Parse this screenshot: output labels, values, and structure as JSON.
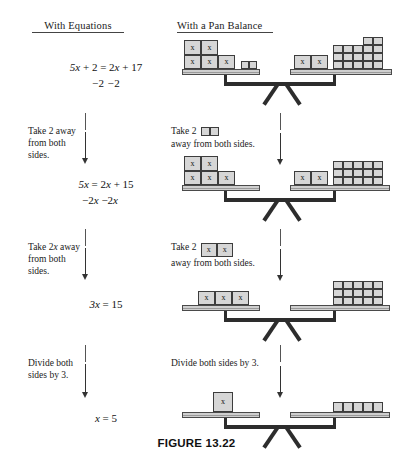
{
  "figure": {
    "caption": "FIGURE 13.22",
    "columns": {
      "equations_header": "With Equations",
      "pan_balance_header": "With a Pan Balance"
    }
  },
  "steps": [
    {
      "id": "step-1",
      "equation_main": "5x + 2 = 2x + 17",
      "equation_operation": "−2          −2",
      "equation_left": "5x + 2",
      "equation_right": "2x + 17",
      "instruction_equations": "",
      "instruction_pan_prefix": "",
      "instruction_pan_suffix": "",
      "balance": {
        "left_x_blocks": 5,
        "left_units": 2,
        "right_x_blocks": 2,
        "right_units": 17,
        "right_grid_cols": 4,
        "right_grid_rows": 3,
        "right_extra_top": 2
      }
    },
    {
      "id": "step-2",
      "equation_main": "5x = 2x + 15",
      "equation_operation": "−2x   −2x",
      "instruction_equations": "Take 2 away from both sides.",
      "instruction_pan_prefix": "Take 2",
      "instruction_pan_suffix": "away from both sides.",
      "removed_piece_type": "unit",
      "removed_piece_count": 2,
      "balance": {
        "left_x_blocks": 5,
        "left_units": 0,
        "right_x_blocks": 2,
        "right_units": 15,
        "right_grid_cols": 5,
        "right_grid_rows": 3
      }
    },
    {
      "id": "step-3",
      "equation_main": "3x = 15",
      "equation_operation": "",
      "instruction_equations": "Take 2x away from both sides.",
      "instruction_pan_prefix": "Take 2",
      "instruction_pan_suffix": "away from both sides.",
      "removed_piece_type": "x",
      "removed_piece_count": 2,
      "removed_piece_label": "x",
      "balance": {
        "left_x_blocks": 3,
        "left_units": 0,
        "right_x_blocks": 0,
        "right_units": 15,
        "right_grid_cols": 5,
        "right_grid_rows": 3
      }
    },
    {
      "id": "step-4",
      "equation_main": "x = 5",
      "equation_operation": "",
      "instruction_equations": "Divide both sides by 3.",
      "instruction_pan_full": "Divide both sides by 3.",
      "balance": {
        "left_x_blocks": 1,
        "left_units": 0,
        "right_x_blocks": 0,
        "right_units": 5,
        "right_grid_cols": 5,
        "right_grid_rows": 1
      }
    }
  ],
  "labels": {
    "x_block_label": "x",
    "eq1_main_pre": "5",
    "eq1_main_post": " + 2 = 2",
    "eq1_main_tail": " + 17",
    "eq1_op": "−2            −2",
    "eq2_main_pre": "5",
    "eq2_main_mid": " = 2",
    "eq2_main_tail": " + 15",
    "eq2_op_pre": "−2",
    "eq2_op_mid": "   −2",
    "eq3_main_pre": "3",
    "eq3_main_tail": " = 15",
    "eq4_main_pre": "",
    "eq4_main_tail": " = 5",
    "note1_l1": "Take 2 away",
    "note1_l2": "from both",
    "note1_l3": "sides.",
    "note2_l1": "Take 2x away",
    "note2_l2": "from both",
    "note2_l3": "sides.",
    "note3_l1": "Divide both",
    "note3_l2": "sides by 3.",
    "rnote1_l1": "Take 2",
    "rnote1_l2": "away from both sides.",
    "rnote2_l1": "Take 2",
    "rnote2_l2": "away from both sides.",
    "rnote3": "Divide both sides by 3."
  },
  "colors": {
    "block_fill": "#d6d6d6",
    "block_stroke": "#3d3d3d",
    "tray_fill": "#cfcfcf",
    "beam_dark": "#2d2d2d",
    "text": "#111111"
  }
}
